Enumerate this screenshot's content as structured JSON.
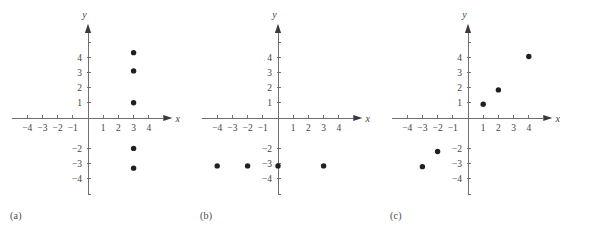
{
  "figure": {
    "background_color": "#ffffff",
    "axis_color": "#6f6f6f",
    "point_color": "#231f20",
    "label_color": "#3f3f3f"
  },
  "panels": [
    {
      "caption": "(a)",
      "x_axis_label": "x",
      "y_axis_label": "y",
      "x_ticks": [
        "-4",
        "-3",
        "-2",
        "-1",
        "1",
        "2",
        "3",
        "4"
      ],
      "y_ticks": [
        "4",
        "3",
        "2",
        "1",
        "-2",
        "-3",
        "-4"
      ],
      "points": [
        {
          "x": 3,
          "y": 4.3
        },
        {
          "x": 3,
          "y": 3.1
        },
        {
          "x": 3,
          "y": 1.0
        },
        {
          "x": 3,
          "y": -2.0
        },
        {
          "x": 3,
          "y": -3.3
        }
      ]
    },
    {
      "caption": "(b)",
      "x_axis_label": "x",
      "y_axis_label": "y",
      "x_ticks": [
        "-4",
        "-3",
        "-2",
        "-1",
        "1",
        "2",
        "3",
        "4"
      ],
      "y_ticks": [
        "4",
        "3",
        "2",
        "1",
        "-2",
        "-3",
        "-4"
      ],
      "points": [
        {
          "x": -4,
          "y": -3.15
        },
        {
          "x": -2,
          "y": -3.15
        },
        {
          "x": 0,
          "y": -3.15
        },
        {
          "x": 3,
          "y": -3.15
        }
      ]
    },
    {
      "caption": "(c)",
      "x_axis_label": "x",
      "y_axis_label": "y",
      "x_ticks": [
        "-4",
        "-3",
        "-2",
        "-1",
        "1",
        "2",
        "3",
        "4"
      ],
      "y_ticks": [
        "4",
        "3",
        "2",
        "1",
        "-2",
        "-3",
        "-4"
      ],
      "points": [
        {
          "x": -3,
          "y": -3.2
        },
        {
          "x": -2,
          "y": -2.2
        },
        {
          "x": 1,
          "y": 0.9
        },
        {
          "x": 2,
          "y": 1.85
        },
        {
          "x": 4,
          "y": 4.05
        }
      ]
    }
  ],
  "chart_data": {
    "type": "scatter",
    "title": "",
    "xlabel": "x",
    "ylabel": "y",
    "xlim": [
      -5,
      5
    ],
    "ylim": [
      -5,
      5
    ],
    "grid": false,
    "legend": "none",
    "panels": [
      {
        "label": "(a)",
        "description": "Five points on the vertical line x = 3",
        "x": [
          3,
          3,
          3,
          3,
          3
        ],
        "y": [
          4.3,
          3.1,
          1.0,
          -2.0,
          -3.3
        ]
      },
      {
        "label": "(b)",
        "description": "Four points on the horizontal line y = -3",
        "x": [
          -4,
          -2,
          0,
          3
        ],
        "y": [
          -3.15,
          -3.15,
          -3.15,
          -3.15
        ]
      },
      {
        "label": "(c)",
        "description": "Five points along the line y = x",
        "x": [
          -3,
          -2,
          1,
          2,
          4
        ],
        "y": [
          -3.2,
          -2.2,
          0.9,
          1.85,
          4.05
        ]
      }
    ]
  }
}
